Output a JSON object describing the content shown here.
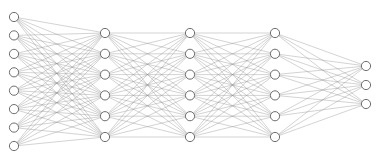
{
  "diagram": {
    "type": "neural-network-graph",
    "canvas": {
      "width": 378,
      "height": 166,
      "background": "#ffffff"
    },
    "style": {
      "node_fill": "#ffffff",
      "node_stroke": "#6e6e6e",
      "node_stroke_width": 1.0,
      "node_radius": 4.6,
      "edge_color": "#8c8c8c",
      "edge_width": 0.45,
      "edge_opacity": 0.85
    },
    "layers": [
      {
        "name": "input-layer",
        "index": 0,
        "node_count": 8,
        "x": 14,
        "nodes_y": [
          17,
          35.4,
          53.9,
          72.3,
          90.7,
          109.1,
          127.6,
          146
        ]
      },
      {
        "name": "hidden-layer-1",
        "index": 1,
        "node_count": 6,
        "x": 105,
        "nodes_y": [
          33,
          53.8,
          74.6,
          95.4,
          116.2,
          137
        ]
      },
      {
        "name": "hidden-layer-2",
        "index": 2,
        "node_count": 6,
        "x": 190,
        "nodes_y": [
          33,
          53.8,
          74.6,
          95.4,
          116.2,
          137
        ]
      },
      {
        "name": "hidden-layer-3",
        "index": 3,
        "node_count": 6,
        "x": 275,
        "nodes_y": [
          33,
          53.8,
          74.6,
          95.4,
          116.2,
          137
        ]
      },
      {
        "name": "output-layer",
        "index": 4,
        "node_count": 3,
        "x": 366,
        "nodes_y": [
          66,
          85,
          104
        ]
      }
    ],
    "connections": [
      {
        "from": 0,
        "to": 1,
        "fully_connected": true,
        "edge_count": 48
      },
      {
        "from": 1,
        "to": 2,
        "fully_connected": true,
        "edge_count": 36
      },
      {
        "from": 2,
        "to": 3,
        "fully_connected": true,
        "edge_count": 36
      },
      {
        "from": 3,
        "to": 4,
        "fully_connected": true,
        "edge_count": 18
      }
    ],
    "totals": {
      "nodes": 29,
      "edges": 138,
      "layers": 5
    }
  }
}
